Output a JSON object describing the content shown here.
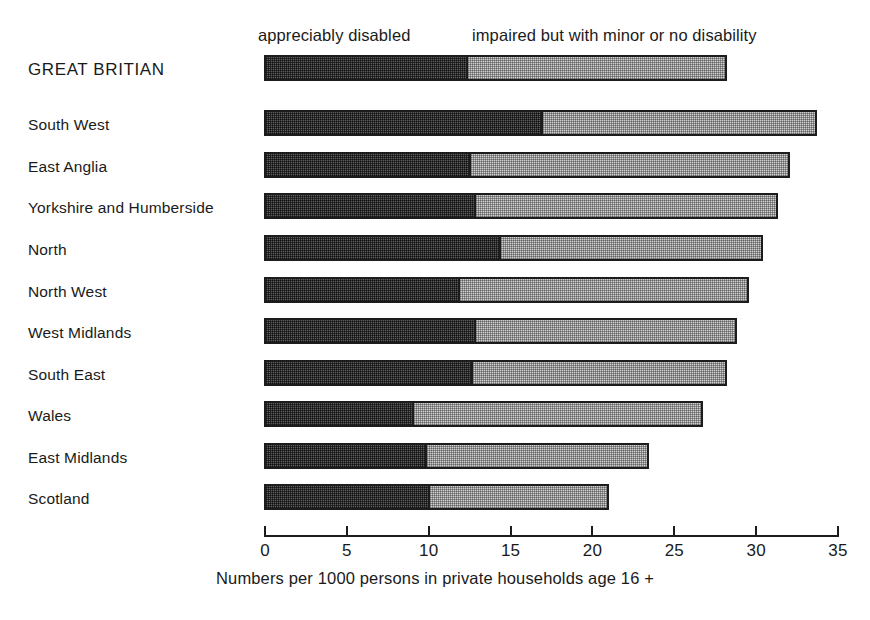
{
  "chart_data": {
    "type": "bar",
    "orientation": "horizontal",
    "stacked": true,
    "title": "",
    "xlabel": "Numbers per 1000 persons in private households age 16 +",
    "ylabel": "",
    "xlim": [
      0,
      35
    ],
    "xticks": [
      0,
      5,
      10,
      15,
      20,
      25,
      30,
      35
    ],
    "xtick_labels": [
      "0",
      "5",
      "10",
      "15",
      "20",
      "25",
      "30",
      "35"
    ],
    "grid": false,
    "legend_position": "top",
    "categories": [
      "GREAT BRITIAN",
      "South West",
      "East Anglia",
      "Yorkshire and Humberside",
      "North",
      "North West",
      "West Midlands",
      "South East",
      "Wales",
      "East Midlands",
      "Scotland"
    ],
    "series": [
      {
        "name": "appreciably disabled",
        "color": "#5e5e5e",
        "values": [
          12.4,
          17.0,
          12.6,
          12.9,
          14.4,
          11.9,
          12.9,
          12.7,
          9.1,
          9.9,
          10.1
        ]
      },
      {
        "name": "impaired but with minor or no disability",
        "color": "#cfcfcf",
        "values": [
          15.9,
          16.8,
          19.5,
          18.5,
          16.1,
          17.7,
          16.0,
          15.6,
          17.7,
          13.6,
          11.0
        ]
      }
    ],
    "totals": [
      28.3,
      33.8,
      32.1,
      31.4,
      30.5,
      29.6,
      28.9,
      28.3,
      26.8,
      23.5,
      21.1
    ]
  },
  "legend": {
    "dark_label": "appreciably disabled",
    "light_label": "impaired but with minor or no disability"
  },
  "axis": {
    "title": "Numbers per 1000 persons in private households age 16 +",
    "ticks": [
      "0",
      "5",
      "10",
      "15",
      "20",
      "25",
      "30",
      "35"
    ]
  },
  "colors": {
    "dark_segment": "#5e5e5e",
    "light_segment": "#cfcfcf",
    "outline": "#1c1c1c",
    "text": "#1a1a1a",
    "background": "#ffffff"
  }
}
